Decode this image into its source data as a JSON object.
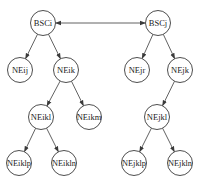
{
  "diagram": {
    "type": "tree",
    "colors": {
      "stroke": "#3a3a3a",
      "text": "#222222",
      "background": "#ffffff"
    },
    "node_radius": 12.5,
    "nodes": [
      {
        "id": "BSCi",
        "label": "BSCi",
        "x": 43,
        "y": 23
      },
      {
        "id": "BSCj",
        "label": "BSCj",
        "x": 158,
        "y": 23
      },
      {
        "id": "NEij",
        "label": "NEij",
        "x": 20,
        "y": 70
      },
      {
        "id": "NEik",
        "label": "NEik",
        "x": 66,
        "y": 70
      },
      {
        "id": "NEjr",
        "label": "NEjr",
        "x": 137,
        "y": 70
      },
      {
        "id": "NEjk",
        "label": "NEjk",
        "x": 180,
        "y": 70
      },
      {
        "id": "NEikl",
        "label": "NEikl",
        "x": 41,
        "y": 117
      },
      {
        "id": "NEikm",
        "label": "NEikm",
        "x": 89,
        "y": 117
      },
      {
        "id": "NEjkl",
        "label": "NEjkl",
        "x": 157,
        "y": 117
      },
      {
        "id": "NEiklp",
        "label": "NEiklp",
        "x": 19,
        "y": 163
      },
      {
        "id": "NEikln",
        "label": "NEikln",
        "x": 64,
        "y": 163
      },
      {
        "id": "NEjklp",
        "label": "NEjklp",
        "x": 134,
        "y": 163
      },
      {
        "id": "NEjkln",
        "label": "NEjkln",
        "x": 180,
        "y": 163
      }
    ],
    "edges": [
      {
        "from": "BSCi",
        "to": "BSCj",
        "bidirectional": true
      },
      {
        "from": "BSCi",
        "to": "NEij"
      },
      {
        "from": "BSCi",
        "to": "NEik"
      },
      {
        "from": "BSCj",
        "to": "NEjr"
      },
      {
        "from": "BSCj",
        "to": "NEjk"
      },
      {
        "from": "NEik",
        "to": "NEikl"
      },
      {
        "from": "NEik",
        "to": "NEikm"
      },
      {
        "from": "NEjk",
        "to": "NEjkl"
      },
      {
        "from": "NEikl",
        "to": "NEiklp"
      },
      {
        "from": "NEikl",
        "to": "NEikln"
      },
      {
        "from": "NEjkl",
        "to": "NEjklp"
      },
      {
        "from": "NEjkl",
        "to": "NEjkln"
      }
    ]
  }
}
